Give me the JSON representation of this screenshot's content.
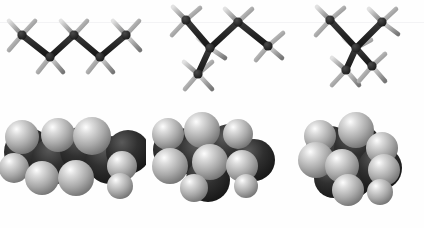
{
  "figure": {
    "formula": "C5H12",
    "background_color": "#ffffff",
    "width_px": 424,
    "height_px": 228,
    "rows": [
      {
        "id": "ball-and-stick",
        "label": "ball-and-stick models",
        "y_top": 0,
        "height": 104
      },
      {
        "id": "space-filling",
        "label": "space-filling models",
        "y_top": 104,
        "height": 124
      }
    ],
    "render_style": "grayscale raster, no axes, no labels, no legend"
  },
  "colors": {
    "carbon": "#2b2b2b",
    "carbon_dark": "#1c1c1c",
    "hydrogen": "#a8a8a8",
    "hydrogen_light": "#d8d8d8",
    "hydrogen_highlight": "#f4f4f4",
    "bond": "#2a2a2a",
    "shadow": "#8e8e8e",
    "background": "#ffffff",
    "scanline": "#f2f2f4"
  },
  "molecules": [
    {
      "index": 0,
      "name": "anti-conformation",
      "caption": "extended zigzag (anti, anti)",
      "carbon_count": 5,
      "hydrogen_count": 12,
      "dihedral_description": "all-anti, 180 degrees",
      "ball_and_stick": {
        "carbons": [
          {
            "id": "C1",
            "cx": 22,
            "cy": 35
          },
          {
            "id": "C2",
            "cx": 50,
            "cy": 57
          },
          {
            "id": "C3",
            "cx": 74,
            "cy": 35
          },
          {
            "id": "C4",
            "cx": 100,
            "cy": 57
          },
          {
            "id": "C5",
            "cx": 126,
            "cy": 35
          }
        ],
        "hydrogens": [
          {
            "on": "C1",
            "cx": 10,
            "cy": 21
          },
          {
            "on": "C1",
            "cx": 34,
            "cy": 21
          },
          {
            "on": "C1",
            "cx": 9,
            "cy": 49
          },
          {
            "on": "C2",
            "cx": 39,
            "cy": 71
          },
          {
            "on": "C2",
            "cx": 62,
            "cy": 71
          },
          {
            "on": "C3",
            "cx": 62,
            "cy": 21
          },
          {
            "on": "C3",
            "cx": 86,
            "cy": 21
          },
          {
            "on": "C4",
            "cx": 89,
            "cy": 71
          },
          {
            "on": "C4",
            "cx": 112,
            "cy": 71
          },
          {
            "on": "C5",
            "cx": 114,
            "cy": 21
          },
          {
            "on": "C5",
            "cx": 138,
            "cy": 21
          },
          {
            "on": "C5",
            "cx": 140,
            "cy": 49
          }
        ],
        "bonds": [
          [
            "C1",
            "C2"
          ],
          [
            "C2",
            "C3"
          ],
          [
            "C3",
            "C4"
          ],
          [
            "C4",
            "C5"
          ]
        ]
      },
      "space_filling": {
        "outline": "elongated slab, widest horizontally",
        "visible_front_hydrogens": 7,
        "bbox": {
          "x": 12,
          "y": 115,
          "w": 126,
          "h": 82
        }
      }
    },
    {
      "index": 1,
      "name": "gauche-conformation",
      "caption": "one gauche interaction (bent)",
      "carbon_count": 5,
      "hydrogen_count": 12,
      "dihedral_description": "anti, gauche (60 degrees)",
      "ball_and_stick": {
        "carbons": [
          {
            "id": "C1",
            "cx": 186,
            "cy": 20
          },
          {
            "id": "C2",
            "cx": 210,
            "cy": 48
          },
          {
            "id": "C3",
            "cx": 198,
            "cy": 72
          },
          {
            "id": "C4",
            "cx": 238,
            "cy": 22
          },
          {
            "id": "C5",
            "cx": 268,
            "cy": 46
          }
        ],
        "bonds": [
          [
            "C1",
            "C2"
          ],
          [
            "C2",
            "C3"
          ],
          [
            "C2",
            "C4"
          ],
          [
            "C4",
            "C5"
          ]
        ]
      },
      "space_filling": {
        "outline": "L-shaped cluster, bent at centre",
        "visible_front_hydrogens": 7,
        "bbox": {
          "x": 160,
          "y": 112,
          "w": 124,
          "h": 90
        }
      }
    },
    {
      "index": 2,
      "name": "gauche-gauche-conformation",
      "caption": "coiled (gauche, gauche) with steric strain",
      "carbon_count": 5,
      "hydrogen_count": 12,
      "dihedral_description": "gauche, gauche (60, 60 degrees) - syn-pentane interaction",
      "ball_and_stick": {
        "carbons": [
          {
            "id": "C1",
            "cx": 330,
            "cy": 20
          },
          {
            "id": "C2",
            "cx": 356,
            "cy": 48
          },
          {
            "id": "C3",
            "cx": 346,
            "cy": 70
          },
          {
            "id": "C4",
            "cx": 382,
            "cy": 22
          },
          {
            "id": "C5",
            "cx": 372,
            "cy": 66
          }
        ],
        "bonds": [
          [
            "C1",
            "C2"
          ],
          [
            "C2",
            "C3"
          ],
          [
            "C2",
            "C4"
          ],
          [
            "C2",
            "C5"
          ]
        ]
      },
      "space_filling": {
        "outline": "compact, nearly circular globule",
        "visible_front_hydrogens": 8,
        "bbox": {
          "x": 306,
          "y": 110,
          "w": 112,
          "h": 96
        }
      }
    }
  ]
}
